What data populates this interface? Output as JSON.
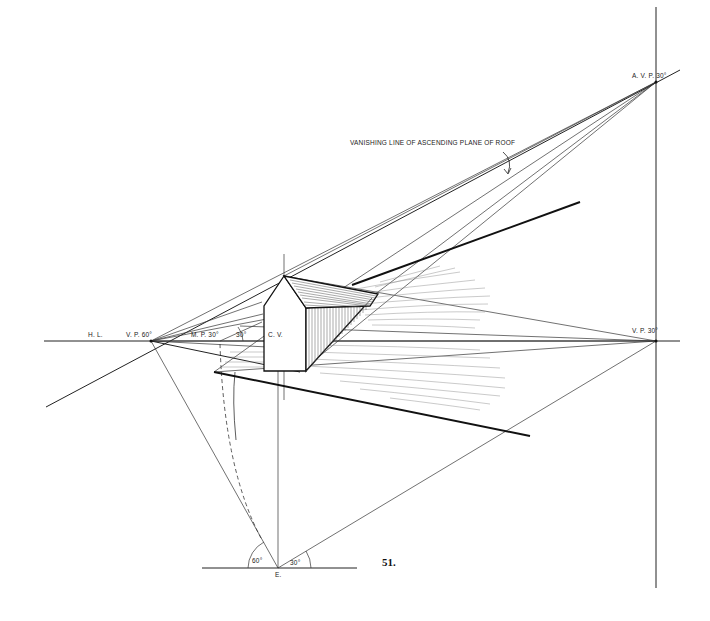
{
  "figure": {
    "number": "51.",
    "annotation": "VANISHING LINE OF ASCENDING PLANE OF ROOF",
    "labels": {
      "horizon_line": "H. L.",
      "vp_left": "V. P. 60°",
      "measuring_point": "M. P. 30°",
      "angle_30_near_mp": "30°",
      "center_of_vision": "C. V.",
      "vp_right": "V. P. 30°",
      "avp": "A. V. P. 30°",
      "station_point": "E.",
      "angle_60": "60°",
      "angle_30_station": "30°"
    },
    "points": {
      "vp_left": [
        151,
        341
      ],
      "vp_right": [
        656,
        341
      ],
      "avp": [
        656,
        82
      ],
      "measuring_point": [
        220,
        341
      ],
      "center_of_vision": [
        278,
        341
      ],
      "station_point": [
        278,
        568
      ]
    },
    "colors": {
      "ink": "#111111",
      "paper": "#ffffff"
    }
  }
}
